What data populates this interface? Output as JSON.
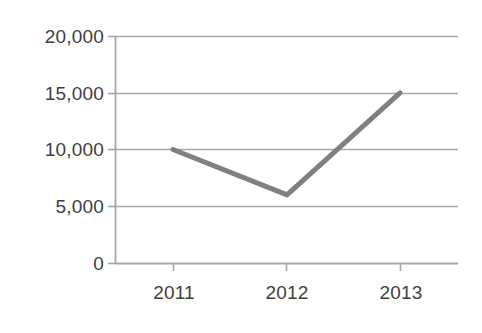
{
  "chart_data": {
    "type": "line",
    "title": "",
    "subtitle": "",
    "xlabel": "",
    "ylabel": "",
    "categories": [
      "2011",
      "2012",
      "2013"
    ],
    "series": [
      {
        "name": "",
        "values": [
          10000,
          6000,
          15000
        ],
        "color": "#808080"
      }
    ],
    "x_tick_labels": [
      "2011",
      "2012",
      "2013"
    ],
    "y_tick_labels": [
      "0",
      "5,000",
      "10,000",
      "15,000",
      "20,000"
    ],
    "y_tick_values": [
      0,
      5000,
      10000,
      15000,
      20000
    ],
    "ylim": [
      0,
      20000
    ],
    "grid": "horizontal",
    "legend": "none",
    "annotations": [],
    "colors": {
      "series_line": "#808080",
      "gridline": "#a6a6a6",
      "axis": "#a6a6a6",
      "tick_label": "#404040",
      "background": "#ffffff"
    }
  },
  "axis": {
    "y_labels": [
      {
        "text": "20,000",
        "value": 20000
      },
      {
        "text": "15,000",
        "value": 15000
      },
      {
        "text": "10,000",
        "value": 10000
      },
      {
        "text": "5,000",
        "value": 5000
      },
      {
        "text": "0",
        "value": 0
      }
    ],
    "x_labels": [
      {
        "text": "2011"
      },
      {
        "text": "2012"
      },
      {
        "text": "2013"
      }
    ]
  }
}
